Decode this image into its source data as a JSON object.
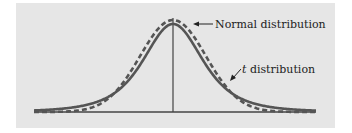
{
  "figure": {
    "labels": {
      "normal": "Normal distribution",
      "t_prefix": "t",
      "t_suffix": " distribution"
    },
    "colors": {
      "background": "#e6e6e6",
      "t_curve": "#555555",
      "normal_curve": "#555555",
      "axis": "#444444",
      "text": "#222222"
    }
  },
  "chart_data": {
    "type": "line",
    "title": "",
    "xlabel": "",
    "ylabel": "",
    "grid": false,
    "legend": "annotations",
    "series": [
      {
        "name": "Normal distribution",
        "style": "dashed",
        "description": "standard normal density, taller peak and thinner tails"
      },
      {
        "name": "t distribution",
        "style": "solid",
        "description": "Student t density, lower peak and heavier tails"
      }
    ],
    "annotations": [
      {
        "text": "Normal distribution",
        "points_to": "peak of dashed curve, right side"
      },
      {
        "text": "t distribution",
        "points_to": "right slope of solid curve"
      }
    ],
    "center_line": true
  }
}
